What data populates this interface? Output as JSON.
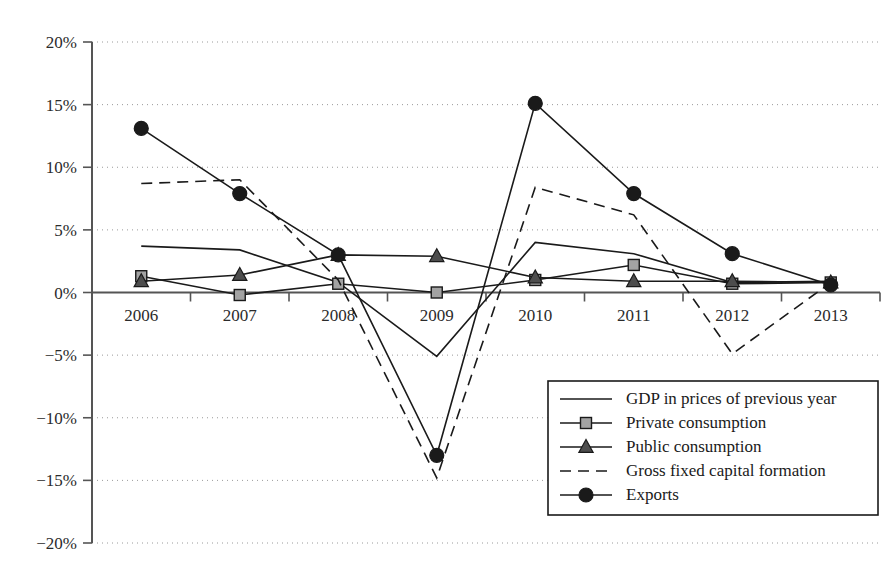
{
  "chart_data": {
    "type": "line",
    "title": "",
    "subtitle": "",
    "xlabel": "",
    "ylabel": "",
    "categories": [
      "2006",
      "2007",
      "2008",
      "2009",
      "2010",
      "2011",
      "2012",
      "2013"
    ],
    "x_tick_labels": [
      "2006",
      "2007",
      "2008",
      "2009",
      "2010",
      "2011",
      "2012",
      "2013"
    ],
    "y_tick_labels": [
      "20%",
      "15%",
      "10%",
      "5%",
      "0%",
      "−5%",
      "−10%",
      "−15%",
      "−20%"
    ],
    "y_tick_values": [
      20,
      15,
      10,
      5,
      0,
      -5,
      -10,
      -15,
      -20
    ],
    "ylim": [
      -20,
      20
    ],
    "grid": true,
    "legend_position": "bottom-right",
    "value_suffix": "%",
    "series": [
      {
        "name": "GDP in prices of previous year",
        "style": "solid",
        "marker": "none",
        "values": [
          3.7,
          3.4,
          0.8,
          -5.1,
          4.0,
          3.1,
          0.8,
          0.9
        ]
      },
      {
        "name": "Private consumption",
        "style": "solid",
        "marker": "square",
        "values": [
          1.3,
          -0.2,
          0.7,
          0.0,
          1.0,
          2.2,
          0.7,
          0.8
        ]
      },
      {
        "name": "Public consumption",
        "style": "solid",
        "marker": "triangle",
        "values": [
          0.9,
          1.4,
          3.0,
          2.9,
          1.2,
          0.9,
          0.9,
          0.8
        ]
      },
      {
        "name": "Gross fixed capital formation",
        "style": "dashed",
        "marker": "none",
        "values": [
          8.7,
          9.0,
          1.0,
          -14.8,
          8.4,
          6.2,
          -4.9,
          0.8
        ]
      },
      {
        "name": "Exports",
        "style": "solid",
        "marker": "circle",
        "values": [
          13.1,
          7.9,
          3.0,
          -13.0,
          15.1,
          7.9,
          3.1,
          0.6
        ]
      }
    ]
  },
  "legend": {
    "entries": [
      {
        "label": "GDP in prices of previous year"
      },
      {
        "label": "Private consumption"
      },
      {
        "label": "Public consumption"
      },
      {
        "label": "Gross fixed capital formation"
      },
      {
        "label": "Exports"
      }
    ]
  },
  "colors": {
    "ink": "#1a1a1a",
    "axis": "#555555",
    "grid": "#9a9a9a",
    "square_fill": "#a3a3a3",
    "triangle_fill": "#4d4d4d",
    "circle_fill": "#1a1a1a"
  }
}
